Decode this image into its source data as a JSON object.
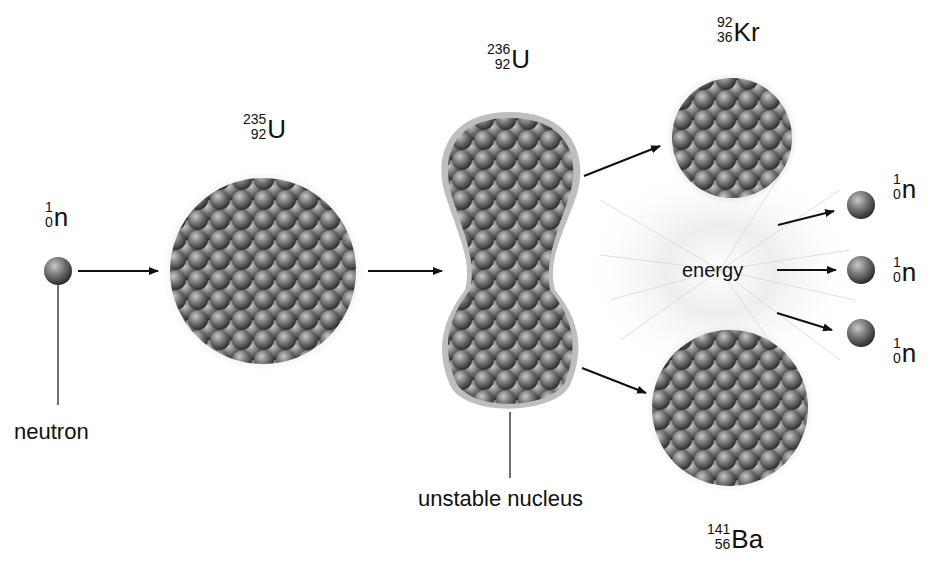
{
  "diagram": {
    "type": "nuclear-fission",
    "colors": {
      "background": "#ffffff",
      "arrow": "#111111",
      "nucleon_dark": "#3a3a3a",
      "nucleon_light": "#9a9a9a",
      "energy_glow": "#e6e6e6"
    },
    "nuclides": {
      "neutron_in": {
        "mass": "1",
        "atomic": "0",
        "symbol": "n"
      },
      "u235": {
        "mass": "235",
        "atomic": "92",
        "symbol": "U"
      },
      "u236": {
        "mass": "236",
        "atomic": "92",
        "symbol": "U"
      },
      "kr92": {
        "mass": "92",
        "atomic": "36",
        "symbol": "Kr"
      },
      "ba141": {
        "mass": "141",
        "atomic": "56",
        "symbol": "Ba"
      },
      "neutron_out_1": {
        "mass": "1",
        "atomic": "0",
        "symbol": "n"
      },
      "neutron_out_2": {
        "mass": "1",
        "atomic": "0",
        "symbol": "n"
      },
      "neutron_out_3": {
        "mass": "1",
        "atomic": "0",
        "symbol": "n"
      }
    },
    "labels": {
      "neutron": "neutron",
      "unstable_nucleus": "unstable nucleus",
      "energy": "energy"
    },
    "flow": [
      {
        "from": "neutron_in",
        "to": "u235"
      },
      {
        "from": "u235",
        "to": "u236"
      },
      {
        "from": "u236",
        "to": "kr92"
      },
      {
        "from": "u236",
        "to": "ba141"
      },
      {
        "from": "energy",
        "to": "neutron_out_1"
      },
      {
        "from": "energy",
        "to": "neutron_out_2"
      },
      {
        "from": "energy",
        "to": "neutron_out_3"
      }
    ]
  }
}
